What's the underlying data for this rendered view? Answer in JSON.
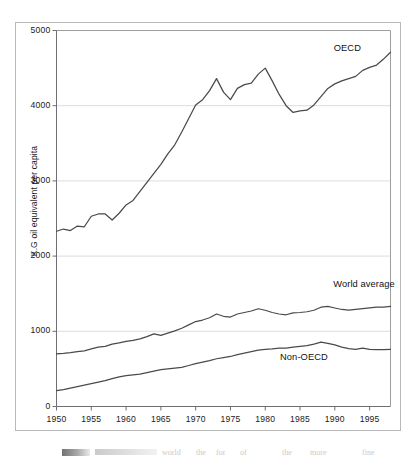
{
  "chart_data": {
    "type": "line",
    "title": "",
    "subtitle": "",
    "xlabel": "",
    "ylabel": "K.G oil equivalent per capita",
    "xlim": [
      1950,
      1998
    ],
    "ylim": [
      0,
      5000
    ],
    "grid": true,
    "grid_axis": "y",
    "legend_position": "inline-labels",
    "x": [
      1950,
      1951,
      1952,
      1953,
      1954,
      1955,
      1956,
      1957,
      1958,
      1959,
      1960,
      1961,
      1962,
      1963,
      1964,
      1965,
      1966,
      1967,
      1968,
      1969,
      1970,
      1971,
      1972,
      1973,
      1974,
      1975,
      1976,
      1977,
      1978,
      1979,
      1980,
      1981,
      1982,
      1983,
      1984,
      1985,
      1986,
      1987,
      1988,
      1989,
      1990,
      1991,
      1992,
      1993,
      1994,
      1995,
      1996,
      1997,
      1998
    ],
    "yticks": [
      0,
      1000,
      2000,
      3000,
      4000,
      5000
    ],
    "ytick_labels": [
      "0",
      "1000",
      "2000",
      "3000",
      "4000",
      "5000"
    ],
    "xticks": [
      1950,
      1955,
      1960,
      1965,
      1970,
      1975,
      1980,
      1985,
      1990,
      1995
    ],
    "xtick_labels": [
      "1950",
      "1955",
      "1960",
      "1965",
      "1970",
      "1975",
      "1980",
      "1985",
      "1990",
      "1995"
    ],
    "series": [
      {
        "name": "OECD",
        "color": "#4a4a4a",
        "label_x": 1993,
        "label_y": 4760,
        "values": [
          2330,
          2360,
          2340,
          2400,
          2390,
          2530,
          2560,
          2560,
          2480,
          2570,
          2680,
          2740,
          2860,
          2980,
          3100,
          3220,
          3360,
          3480,
          3650,
          3830,
          4010,
          4080,
          4200,
          4360,
          4180,
          4080,
          4230,
          4280,
          4300,
          4420,
          4500,
          4330,
          4150,
          4000,
          3910,
          3930,
          3940,
          4010,
          4120,
          4230,
          4290,
          4330,
          4360,
          4390,
          4470,
          4510,
          4540,
          4620,
          4710
        ]
      },
      {
        "name": "World average",
        "color": "#4a4a4a",
        "label_x": 1991.5,
        "label_y": 1610,
        "values": [
          700,
          705,
          715,
          730,
          740,
          765,
          790,
          800,
          830,
          845,
          865,
          880,
          900,
          930,
          965,
          945,
          975,
          1005,
          1040,
          1085,
          1130,
          1150,
          1180,
          1230,
          1200,
          1190,
          1230,
          1250,
          1270,
          1300,
          1280,
          1250,
          1230,
          1220,
          1245,
          1250,
          1260,
          1280,
          1320,
          1330,
          1310,
          1290,
          1280,
          1290,
          1300,
          1310,
          1320,
          1320,
          1330
        ]
      },
      {
        "name": "Non-OECD",
        "color": "#4a4a4a",
        "label_x": 1985,
        "label_y": 640,
        "values": [
          210,
          225,
          245,
          265,
          285,
          305,
          325,
          345,
          370,
          395,
          410,
          420,
          430,
          450,
          470,
          490,
          500,
          510,
          520,
          545,
          570,
          590,
          610,
          635,
          650,
          665,
          690,
          710,
          730,
          750,
          760,
          765,
          775,
          775,
          790,
          800,
          810,
          830,
          855,
          840,
          820,
          790,
          770,
          760,
          775,
          760,
          755,
          755,
          760
        ]
      }
    ]
  },
  "axis": {
    "y_title": "K.G oil equivalent per capita"
  },
  "caption": {
    "ghost_fragments": [
      {
        "text": "world",
        "x": 162
      },
      {
        "text": "the",
        "x": 196
      },
      {
        "text": "for",
        "x": 216
      },
      {
        "text": "of",
        "x": 240
      },
      {
        "text": "the",
        "x": 282
      },
      {
        "text": "more",
        "x": 310
      },
      {
        "text": "fine",
        "x": 362
      }
    ]
  }
}
